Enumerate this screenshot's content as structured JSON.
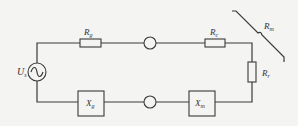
{
  "diagram": {
    "type": "circuit",
    "components": {
      "source": {
        "name": "U",
        "subscript": "s"
      },
      "r_series_top_left": {
        "name": "R",
        "subscript": "g"
      },
      "r_series_top_right": {
        "name": "R",
        "subscript": "c"
      },
      "r_vertical_right": {
        "name": "R",
        "subscript": "r"
      },
      "x_bottom_left": {
        "name": "X",
        "subscript": "g"
      },
      "x_bottom_right": {
        "name": "X",
        "subscript": "m"
      },
      "r_ground": {
        "name": "R",
        "subscript": "m"
      }
    }
  }
}
